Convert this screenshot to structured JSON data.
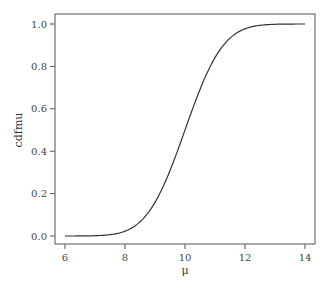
{
  "chart_data": {
    "type": "line",
    "title": "",
    "xlabel": "μ",
    "ylabel": "cdfmu",
    "xlim": [
      6,
      14
    ],
    "ylim": [
      0,
      1
    ],
    "x_ticks": [
      6,
      8,
      10,
      12,
      14
    ],
    "x_tick_labels": [
      "6",
      "8",
      "10",
      "12",
      "14"
    ],
    "y_ticks": [
      0.0,
      0.2,
      0.4,
      0.6,
      0.8,
      1.0
    ],
    "y_tick_labels": [
      "0.0",
      "0.2",
      "0.4",
      "0.6",
      "0.8",
      "1.0"
    ],
    "grid": false,
    "legend": null,
    "series": [
      {
        "name": "cdfmu",
        "color": "#333333",
        "x": [
          6,
          6.5,
          7,
          7.5,
          8,
          8.5,
          9,
          9.5,
          10,
          10.5,
          11,
          11.5,
          12,
          12.5,
          13,
          13.5,
          14
        ],
        "y": [
          0.0,
          0.0002,
          0.0013,
          0.0062,
          0.0228,
          0.0668,
          0.1587,
          0.3085,
          0.5,
          0.6915,
          0.8413,
          0.9332,
          0.9772,
          0.9938,
          0.9987,
          0.9998,
          1.0
        ]
      }
    ]
  }
}
